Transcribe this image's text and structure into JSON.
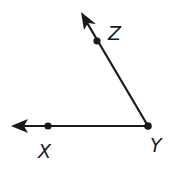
{
  "diagram": {
    "type": "angle",
    "vertex": "Y",
    "rays": [
      "YX",
      "YZ"
    ],
    "angle_name": "angle XYZ",
    "stroke_color": "#1a1a1a",
    "background": "#ffffff"
  },
  "points": {
    "X": {
      "label": "X"
    },
    "Y": {
      "label": "Y"
    },
    "Z": {
      "label": "Z"
    }
  }
}
